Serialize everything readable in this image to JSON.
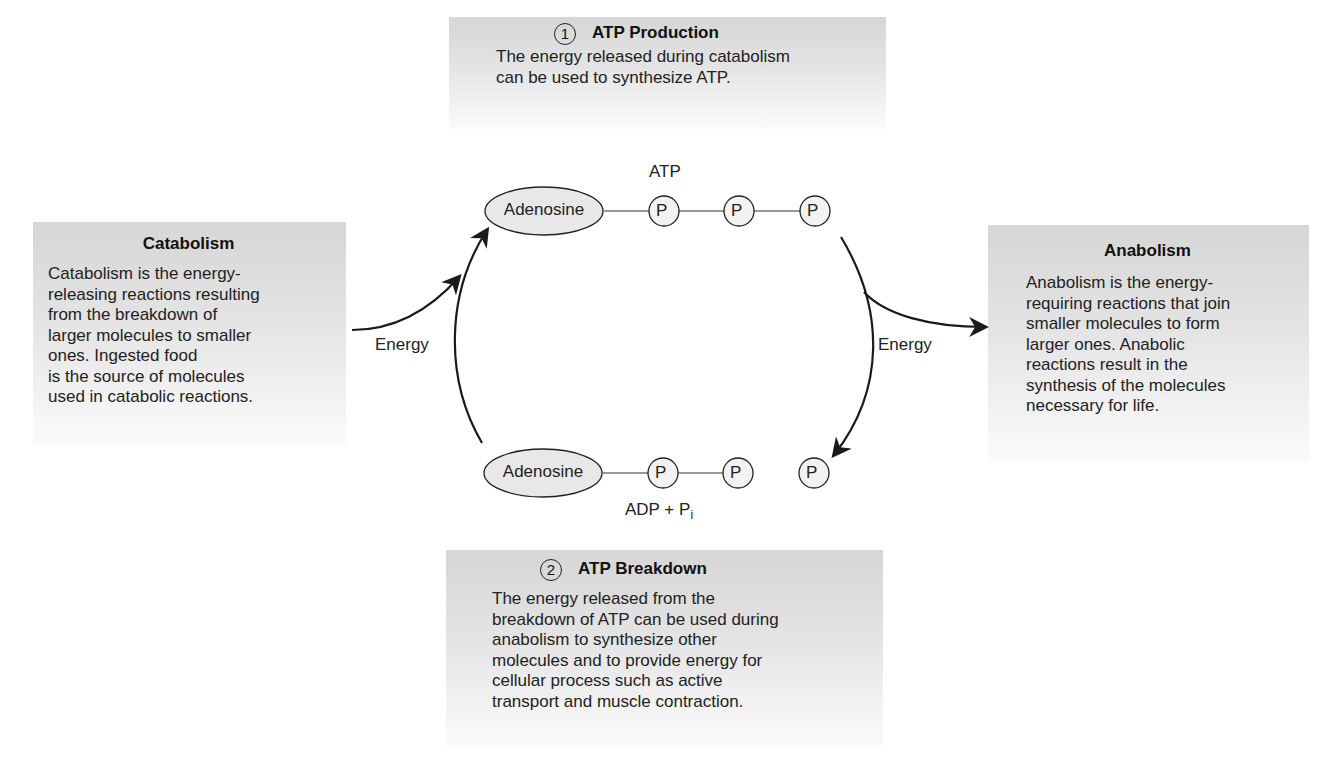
{
  "boxes": {
    "atp_production": {
      "number": "1",
      "title": "ATP Production",
      "lines": [
        "The energy released during catabolism",
        "can be used to synthesize ATP."
      ]
    },
    "atp_breakdown": {
      "number": "2",
      "title": "ATP Breakdown",
      "lines": [
        "The energy released from the",
        "breakdown of ATP can be used during",
        "anabolism to synthesize other",
        "molecules and to provide energy for",
        "cellular process such as active",
        "transport and muscle contraction."
      ]
    },
    "catabolism": {
      "title": "Catabolism",
      "lines": [
        "Catabolism is the energy-",
        "releasing reactions resulting",
        "from the breakdown of",
        "larger molecules to smaller",
        "ones. Ingested food",
        "is the source of molecules",
        "used in catabolic reactions."
      ]
    },
    "anabolism": {
      "title": "Anabolism",
      "lines": [
        "Anabolism is the energy-",
        "requiring reactions that join",
        "smaller molecules to form",
        "larger ones. Anabolic",
        "reactions result in the",
        "synthesis of the molecules",
        "necessary for life."
      ]
    }
  },
  "molecules": {
    "atp": {
      "label": "ATP",
      "adenosine": "Adenosine",
      "phosphates": [
        "P",
        "P",
        "P"
      ]
    },
    "adp": {
      "label_main": "ADP + P",
      "label_sub": "i",
      "adenosine": "Adenosine",
      "phosphates": [
        "P",
        "P"
      ],
      "free_phosphate": "P"
    }
  },
  "arrows": {
    "left_energy": "Energy",
    "right_energy": "Energy"
  },
  "colors": {
    "box_top": "#d6d6d6",
    "box_bottom": "#fbfbfb",
    "ellipse_fill": "#e8e8e8",
    "stroke": "#1a1a1a"
  }
}
